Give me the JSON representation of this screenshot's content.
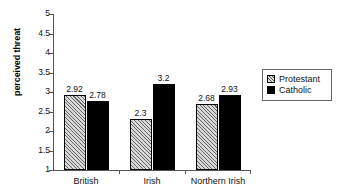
{
  "chart_data": {
    "type": "bar",
    "title": "",
    "xlabel": "",
    "ylabel": "perceived threat",
    "categories": [
      "British",
      "Irish",
      "Northern Irish"
    ],
    "series": [
      {
        "name": "Protestant",
        "values": [
          2.92,
          2.3,
          2.68
        ],
        "labels": [
          "2.92",
          "2.3",
          "2.68"
        ],
        "fill": "hatched",
        "color": "#d8d8d8"
      },
      {
        "name": "Catholic",
        "values": [
          2.78,
          3.2,
          2.93
        ],
        "labels": [
          "2.78",
          "3.2",
          "2.93"
        ],
        "fill": "solid",
        "color": "#000000"
      }
    ],
    "ylim": [
      1,
      5
    ],
    "ytick_values": [
      1,
      1.5,
      2,
      2.5,
      3,
      3.5,
      4,
      4.5,
      5
    ],
    "ytick_labels": [
      "1",
      "1.5",
      "2",
      "2.5",
      "3",
      "3.5",
      "4",
      "4.5",
      "5"
    ],
    "grid": false,
    "legend_position": "right",
    "legend_entries": [
      "Protestant",
      "Catholic"
    ]
  },
  "axis": {
    "y_label": "perceived threat",
    "y_min": 1,
    "y_max": 5
  },
  "legend": {
    "items": [
      {
        "label": "Protestant"
      },
      {
        "label": "Catholic"
      }
    ]
  }
}
